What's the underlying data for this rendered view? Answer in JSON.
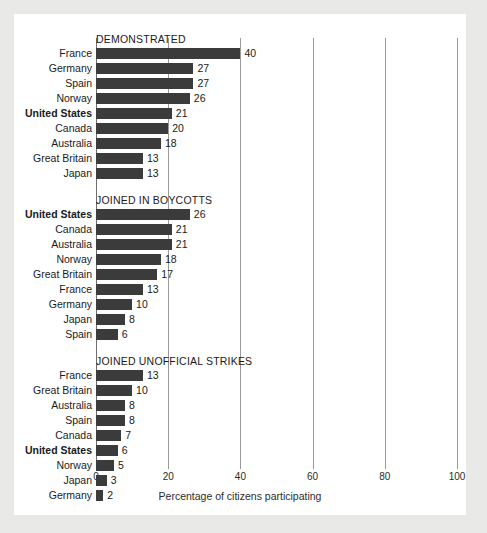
{
  "chart_data": {
    "type": "bar",
    "orientation": "horizontal",
    "title": "",
    "xlabel": "Percentage of citizens participating",
    "ylabel": "",
    "xlim": [
      0,
      100
    ],
    "xticks": [
      0,
      20,
      40,
      60,
      80,
      100
    ],
    "xtick_labels": [
      "0",
      "20",
      "40",
      "60",
      "80",
      "100"
    ],
    "grid": true,
    "legend": "none",
    "highlight_category": "United States",
    "bar_color": "#3b3b3b",
    "panels": [
      {
        "title": "DEMONSTRATED",
        "categories": [
          "France",
          "Germany",
          "Spain",
          "Norway",
          "United States",
          "Canada",
          "Australia",
          "Great Britain",
          "Japan"
        ],
        "values": [
          40,
          27,
          27,
          26,
          21,
          20,
          18,
          13,
          13
        ]
      },
      {
        "title": "JOINED IN BOYCOTTS",
        "categories": [
          "United States",
          "Canada",
          "Australia",
          "Norway",
          "Great Britain",
          "France",
          "Germany",
          "Japan",
          "Spain"
        ],
        "values": [
          26,
          21,
          21,
          18,
          17,
          13,
          10,
          8,
          6
        ]
      },
      {
        "title": "JOINED UNOFFICIAL STRIKES",
        "categories": [
          "France",
          "Great Britain",
          "Australia",
          "Spain",
          "Canada",
          "United States",
          "Norway",
          "Japan",
          "Germany"
        ],
        "values": [
          13,
          10,
          8,
          8,
          7,
          6,
          5,
          3,
          2
        ]
      }
    ]
  }
}
